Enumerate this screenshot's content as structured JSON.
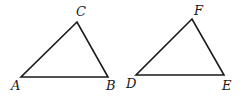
{
  "figure": {
    "triangles": [
      {
        "name": "ABC",
        "vertices": [
          {
            "label": "A",
            "x": 21,
            "y": 77,
            "lx": 11,
            "ly": 90
          },
          {
            "label": "B",
            "x": 108,
            "y": 77,
            "lx": 106,
            "ly": 90
          },
          {
            "label": "C",
            "x": 77,
            "y": 22,
            "lx": 76,
            "ly": 16
          }
        ]
      },
      {
        "name": "DEF",
        "vertices": [
          {
            "label": "D",
            "x": 136,
            "y": 75,
            "lx": 126,
            "ly": 88
          },
          {
            "label": "E",
            "x": 224,
            "y": 75,
            "lx": 222,
            "ly": 90
          },
          {
            "label": "F",
            "x": 192,
            "y": 19,
            "lx": 194,
            "ly": 15
          }
        ]
      }
    ],
    "colors": {
      "stroke": "#1a1a1a",
      "background": "#ffffff"
    }
  }
}
